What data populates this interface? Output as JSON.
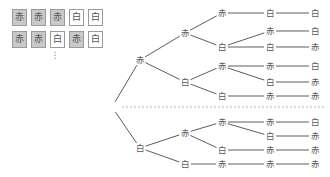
{
  "labels": {
    "red": "赤",
    "white": "白",
    "vertical_ellipsis": "⋮"
  },
  "colors": {
    "red_cell_fill": "#c9c9c9",
    "white_cell_fill": "#ffffff",
    "cell_border": "#9a9a9a",
    "text": "#5a5a5a",
    "edge": "#4a4a4a",
    "divider": "#9aa0b0"
  },
  "sample_grid": {
    "rows": [
      {
        "cells": [
          {
            "label": "赤",
            "kind": "red"
          },
          {
            "label": "赤",
            "kind": "red"
          },
          {
            "label": "赤",
            "kind": "red"
          },
          {
            "label": "白",
            "kind": "white"
          },
          {
            "label": "白",
            "kind": "white"
          }
        ]
      },
      {
        "cells": [
          {
            "label": "赤",
            "kind": "red"
          },
          {
            "label": "赤",
            "kind": "red"
          },
          {
            "label": "白",
            "kind": "white"
          },
          {
            "label": "赤",
            "kind": "red"
          },
          {
            "label": "白",
            "kind": "white"
          }
        ]
      }
    ],
    "continuation": "⋮"
  },
  "tree": {
    "root": {
      "x": 112,
      "y": 107
    },
    "nodes": [
      {
        "id": "n1",
        "label": "赤",
        "kind": "red",
        "x": 140,
        "y": 60
      },
      {
        "id": "n2",
        "label": "赤",
        "kind": "red",
        "x": 185,
        "y": 33
      },
      {
        "id": "n3",
        "label": "赤",
        "kind": "red",
        "x": 222,
        "y": 13
      },
      {
        "id": "n4",
        "label": "白",
        "kind": "white",
        "x": 270,
        "y": 13
      },
      {
        "id": "n5",
        "label": "白",
        "kind": "white",
        "x": 315,
        "y": 13
      },
      {
        "id": "n6",
        "label": "白",
        "kind": "white",
        "x": 222,
        "y": 47
      },
      {
        "id": "n7",
        "label": "赤",
        "kind": "red",
        "x": 270,
        "y": 31
      },
      {
        "id": "n8",
        "label": "白",
        "kind": "white",
        "x": 315,
        "y": 31
      },
      {
        "id": "n9",
        "label": "白",
        "kind": "white",
        "x": 270,
        "y": 47
      },
      {
        "id": "n10",
        "label": "赤",
        "kind": "red",
        "x": 315,
        "y": 47
      },
      {
        "id": "n11",
        "label": "白",
        "kind": "white",
        "x": 185,
        "y": 82
      },
      {
        "id": "n12",
        "label": "赤",
        "kind": "red",
        "x": 222,
        "y": 66
      },
      {
        "id": "n13",
        "label": "赤",
        "kind": "red",
        "x": 270,
        "y": 66
      },
      {
        "id": "n14",
        "label": "白",
        "kind": "white",
        "x": 315,
        "y": 66
      },
      {
        "id": "n15",
        "label": "白",
        "kind": "white",
        "x": 270,
        "y": 82
      },
      {
        "id": "n16",
        "label": "赤",
        "kind": "red",
        "x": 315,
        "y": 82
      },
      {
        "id": "n17",
        "label": "白",
        "kind": "white",
        "x": 222,
        "y": 96
      },
      {
        "id": "n18",
        "label": "赤",
        "kind": "red",
        "x": 270,
        "y": 96
      },
      {
        "id": "n19",
        "label": "赤",
        "kind": "red",
        "x": 315,
        "y": 96
      },
      {
        "id": "n20",
        "label": "白",
        "kind": "white",
        "x": 140,
        "y": 148
      },
      {
        "id": "n21",
        "label": "赤",
        "kind": "red",
        "x": 185,
        "y": 133
      },
      {
        "id": "n22",
        "label": "赤",
        "kind": "red",
        "x": 222,
        "y": 122
      },
      {
        "id": "n23",
        "label": "赤",
        "kind": "red",
        "x": 270,
        "y": 122
      },
      {
        "id": "n24",
        "label": "白",
        "kind": "white",
        "x": 315,
        "y": 122
      },
      {
        "id": "n25",
        "label": "白",
        "kind": "white",
        "x": 270,
        "y": 136
      },
      {
        "id": "n26",
        "label": "赤",
        "kind": "red",
        "x": 315,
        "y": 136
      },
      {
        "id": "n27",
        "label": "白",
        "kind": "white",
        "x": 222,
        "y": 150
      },
      {
        "id": "n28",
        "label": "赤",
        "kind": "red",
        "x": 270,
        "y": 150
      },
      {
        "id": "n29",
        "label": "赤",
        "kind": "red",
        "x": 315,
        "y": 150
      },
      {
        "id": "n30",
        "label": "白",
        "kind": "white",
        "x": 185,
        "y": 164
      },
      {
        "id": "n31",
        "label": "赤",
        "kind": "red",
        "x": 222,
        "y": 164
      },
      {
        "id": "n32",
        "label": "赤",
        "kind": "red",
        "x": 270,
        "y": 164
      },
      {
        "id": "n33",
        "label": "赤",
        "kind": "red",
        "x": 315,
        "y": 164
      }
    ],
    "edges": [
      [
        112,
        107,
        140,
        60
      ],
      [
        112,
        107,
        140,
        148
      ],
      [
        140,
        60,
        185,
        33
      ],
      [
        140,
        60,
        185,
        82
      ],
      [
        185,
        33,
        222,
        13
      ],
      [
        185,
        33,
        222,
        47
      ],
      [
        222,
        13,
        270,
        13
      ],
      [
        270,
        13,
        315,
        13
      ],
      [
        222,
        47,
        270,
        31
      ],
      [
        270,
        31,
        315,
        31
      ],
      [
        222,
        47,
        270,
        47
      ],
      [
        270,
        47,
        315,
        47
      ],
      [
        185,
        82,
        222,
        66
      ],
      [
        185,
        82,
        222,
        96
      ],
      [
        222,
        66,
        270,
        66
      ],
      [
        270,
        66,
        315,
        66
      ],
      [
        222,
        66,
        270,
        82
      ],
      [
        270,
        82,
        315,
        82
      ],
      [
        222,
        96,
        270,
        96
      ],
      [
        270,
        96,
        315,
        96
      ],
      [
        140,
        148,
        185,
        133
      ],
      [
        140,
        148,
        185,
        164
      ],
      [
        185,
        133,
        222,
        122
      ],
      [
        185,
        133,
        222,
        150
      ],
      [
        222,
        122,
        270,
        122
      ],
      [
        270,
        122,
        315,
        122
      ],
      [
        222,
        122,
        270,
        136
      ],
      [
        270,
        136,
        315,
        136
      ],
      [
        222,
        150,
        270,
        150
      ],
      [
        270,
        150,
        315,
        150
      ],
      [
        185,
        164,
        222,
        164
      ],
      [
        222,
        164,
        270,
        164
      ],
      [
        270,
        164,
        315,
        164
      ]
    ],
    "divider": {
      "x1": 122,
      "x2": 326,
      "y": 107,
      "style": "dashed"
    }
  }
}
